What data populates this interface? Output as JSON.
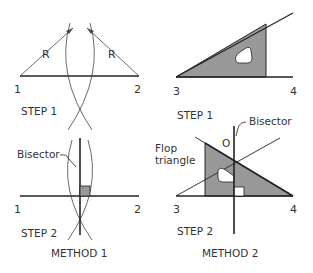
{
  "colors": {
    "line": "#222222",
    "thin": "#444444",
    "fill": "#999999",
    "background": "#ffffff"
  },
  "method1": {
    "title": "METHOD 1",
    "step1": {
      "label": "STEP 1",
      "point_left": "1",
      "point_right": "2",
      "radius_left": "R",
      "radius_right": "R"
    },
    "step2": {
      "label": "STEP 2",
      "point_left": "1",
      "point_right": "2",
      "bisector_label": "Bisector"
    }
  },
  "method2": {
    "title": "METHOD 2",
    "step1": {
      "label": "STEP 1",
      "point_left": "3",
      "point_right": "4"
    },
    "step2": {
      "label": "STEP 2",
      "point_left": "3",
      "point_right": "4",
      "bisector_label": "Bisector",
      "point_o": "O",
      "flop_label_line1": "Flop",
      "flop_label_line2": "triangle"
    }
  }
}
